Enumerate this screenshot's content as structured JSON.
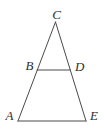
{
  "figure": {
    "type": "geometry-diagram",
    "labels": {
      "A": "A",
      "B": "B",
      "C": "C",
      "D": "D",
      "E": "E"
    },
    "geometry": {
      "apex_C": {
        "x": 55.5,
        "y": 22
      },
      "bottom_left_A": {
        "x": 18,
        "y": 121
      },
      "bottom_right_E": {
        "x": 86,
        "y": 121
      },
      "midsegment_B": {
        "x": 37,
        "y": 70
      },
      "midsegment_D": {
        "x": 70.5,
        "y": 70
      }
    },
    "colors": {
      "line": "#4a4a4a",
      "label": "#2e2e2e",
      "background": "#ffffff"
    }
  }
}
